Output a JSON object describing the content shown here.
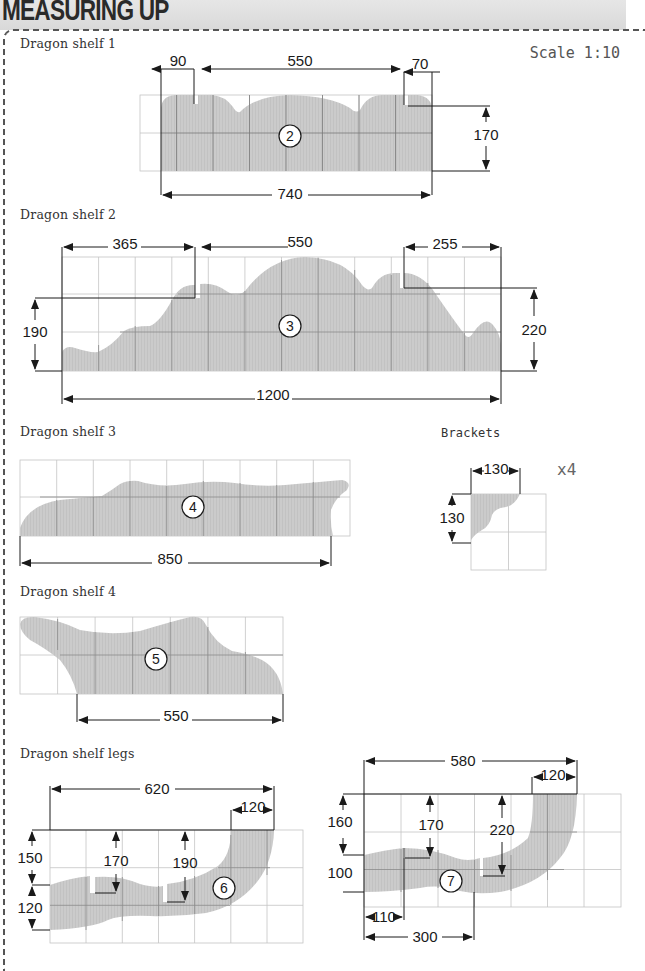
{
  "header": {
    "title": "MEASURING UP"
  },
  "scale_label": "Scale 1:10",
  "units": "mm",
  "colors": {
    "shape_fill": "#c8c8c8",
    "grid": "#bdbdbd",
    "dim_line": "#1a1a1a",
    "banner": "#dedede"
  },
  "parts": [
    {
      "id": "shelf1",
      "label": "Dragon shelf 1",
      "part_number": "2",
      "dimensions": {
        "left_notch": "90",
        "center": "550",
        "right_notch": "70",
        "height": "170",
        "width": "740"
      }
    },
    {
      "id": "shelf2",
      "label": "Dragon shelf 2",
      "part_number": "3",
      "dimensions": {
        "left_notch": "365",
        "center": "550",
        "right_notch": "255",
        "left_height": "190",
        "right_height": "220",
        "width": "1200"
      }
    },
    {
      "id": "shelf3",
      "label": "Dragon shelf 3",
      "part_number": "4",
      "dimensions": {
        "width": "850"
      }
    },
    {
      "id": "brackets",
      "label": "Brackets",
      "quantity": "x4",
      "dimensions": {
        "width": "130",
        "height": "130"
      }
    },
    {
      "id": "shelf4",
      "label": "Dragon shelf 4",
      "part_number": "5",
      "dimensions": {
        "width": "550"
      }
    },
    {
      "id": "legs",
      "label": "Dragon shelf legs",
      "legs": [
        {
          "part_number": "6",
          "dimensions": {
            "width": "620",
            "top": "120",
            "left_top": "150",
            "left_bottom": "120",
            "notch1": "170",
            "notch2": "190"
          }
        },
        {
          "part_number": "7",
          "dimensions": {
            "width": "580",
            "top": "120",
            "left_top": "160",
            "left_bottom": "100",
            "notch1": "170",
            "notch2": "220",
            "bottom1": "110",
            "bottom2": "300"
          }
        }
      ]
    }
  ]
}
